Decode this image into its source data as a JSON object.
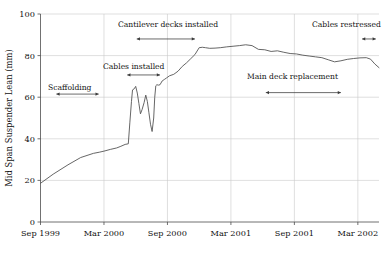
{
  "chart_data": {
    "type": "line",
    "title": "",
    "xlabel": "",
    "ylabel": "Mid Span Suspender Lean (mm)",
    "ylim": [
      0,
      100
    ],
    "yticks": [
      0,
      20,
      40,
      60,
      80,
      100
    ],
    "ytick_labels": [
      "0",
      "20",
      "40",
      "60",
      "80",
      "100"
    ],
    "xtick_labels": [
      "Sep 1999",
      "Mar 2000",
      "Sep 2000",
      "Mar 2001",
      "Sep 2001",
      "Mar 2002"
    ],
    "xlim_months": [
      0,
      32
    ],
    "grid": "horizontal-and-vertical",
    "legend": "none",
    "series": [
      {
        "name": "Mid span suspender lean",
        "x_months": [
          0.0,
          1.2,
          2.6,
          3.8,
          5.0,
          5.6,
          6.1,
          6.6,
          7.2,
          7.6,
          8.0,
          8.3,
          8.45,
          8.6,
          8.7,
          8.85,
          9.0,
          9.15,
          9.3,
          9.45,
          9.6,
          9.8,
          9.95,
          10.1,
          10.25,
          10.4,
          10.55,
          10.7,
          10.8,
          10.9,
          11.0,
          11.15,
          11.3,
          11.5,
          11.7,
          11.9,
          12.2,
          12.6,
          13.0,
          13.4,
          13.8,
          14.2,
          14.6,
          15.0,
          15.3,
          15.6,
          16.0,
          16.5,
          17.0,
          17.6,
          18.2,
          18.8,
          19.4,
          20.0,
          20.6,
          21.2,
          21.8,
          22.4,
          23.0,
          23.6,
          24.2,
          24.8,
          25.4,
          26.0,
          26.6,
          27.2,
          27.8,
          28.4,
          29.0,
          29.6,
          30.2,
          30.8,
          31.2,
          31.6,
          32.0
        ],
        "y_values": [
          18.6,
          23.0,
          27.5,
          31.0,
          33.0,
          33.6,
          34.2,
          34.9,
          35.6,
          36.4,
          37.3,
          37.6,
          48.0,
          58.0,
          63.5,
          64.0,
          65.2,
          62.0,
          57.0,
          52.0,
          54.0,
          57.5,
          61.0,
          58.0,
          52.5,
          47.0,
          43.5,
          50.0,
          60.0,
          65.5,
          66.0,
          65.8,
          66.0,
          67.8,
          68.5,
          69.2,
          70.3,
          71.0,
          72.5,
          74.8,
          76.5,
          78.5,
          80.5,
          83.8,
          84.0,
          83.8,
          83.5,
          83.6,
          83.8,
          84.2,
          84.5,
          84.8,
          85.2,
          84.8,
          83.0,
          82.8,
          82.0,
          82.3,
          81.6,
          81.0,
          80.8,
          80.2,
          79.8,
          79.4,
          79.0,
          78.0,
          77.0,
          77.5,
          78.2,
          78.6,
          78.9,
          79.0,
          78.3,
          76.0,
          74.2
        ]
      }
    ],
    "annotations": [
      {
        "label": "Scaffolding",
        "text_x_px": 48,
        "text_y_px": 90,
        "bar_y_value": 61.5,
        "bar_x_start_months": 1.5,
        "bar_x_end_months": 5.5
      },
      {
        "label": "Cables installed",
        "text_x_px": 103,
        "text_y_px": 69,
        "bar_y_value": 70.7,
        "bar_x_start_months": 8.2,
        "bar_x_end_months": 11.3
      },
      {
        "label": "Cantilever decks installed",
        "text_x_px": 118,
        "text_y_px": 27,
        "bar_y_value": 88.0,
        "bar_x_start_months": 9.1,
        "bar_x_end_months": 14.6
      },
      {
        "label": "Main deck replacement",
        "text_x_px": 247,
        "text_y_px": 79,
        "bar_y_value": 62.2,
        "bar_x_start_months": 21.3,
        "bar_x_end_months": 28.4
      },
      {
        "label": "Cables restressed",
        "text_x_px": 312,
        "text_y_px": 27,
        "bar_y_value": 88.0,
        "bar_x_start_months": 30.4,
        "bar_x_end_months": 31.7
      }
    ]
  }
}
